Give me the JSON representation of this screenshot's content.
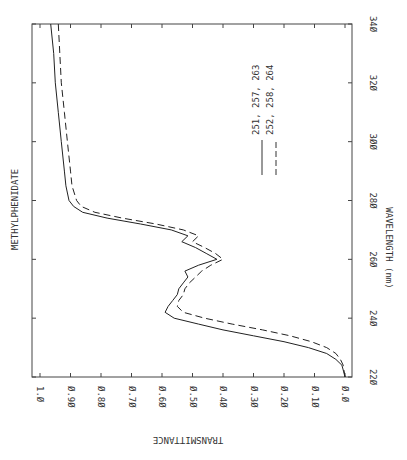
{
  "chart_data": {
    "type": "line",
    "title": "METHYLPHENIDATE",
    "xlabel": "WAVELENGTH (nm)",
    "ylabel": "TRANSMITTANCE",
    "orientation": "rotated 90° (wavelength axis vertical on right, transmittance axis horizontal along bottom, reversed)",
    "xlim": [
      220,
      340
    ],
    "ylim": [
      0.0,
      1.0
    ],
    "x_ticks": [
      "220",
      "240",
      "260",
      "280",
      "300",
      "320",
      "340"
    ],
    "y_ticks": [
      "1.0",
      "0.90",
      "0.80",
      "0.70",
      "0.60",
      "0.50",
      "0.40",
      "0.30",
      "0.20",
      "0.10",
      "0.0"
    ],
    "grid": false,
    "legend_position": "upper-center",
    "series": [
      {
        "name": "251, 257, 263",
        "style": "solid",
        "x": [
          220,
          222,
          224,
          226,
          228,
          230,
          232,
          234,
          236,
          238,
          240,
          242,
          244,
          246,
          248,
          250,
          252,
          254,
          256,
          258,
          260,
          262,
          264,
          266,
          268,
          270,
          272,
          274,
          276,
          278,
          280,
          285,
          290,
          300,
          310,
          320,
          330,
          340
        ],
        "values": [
          0.0,
          0.005,
          0.01,
          0.03,
          0.06,
          0.12,
          0.2,
          0.3,
          0.4,
          0.48,
          0.56,
          0.59,
          0.58,
          0.565,
          0.55,
          0.545,
          0.53,
          0.515,
          0.525,
          0.48,
          0.42,
          0.455,
          0.49,
          0.535,
          0.515,
          0.57,
          0.67,
          0.78,
          0.86,
          0.89,
          0.905,
          0.915,
          0.92,
          0.93,
          0.94,
          0.95,
          0.955,
          0.965
        ]
      },
      {
        "name": "252, 258, 264",
        "style": "dashed",
        "x": [
          220,
          222,
          224,
          226,
          228,
          230,
          232,
          234,
          236,
          238,
          240,
          242,
          244,
          246,
          248,
          250,
          252,
          254,
          256,
          258,
          260,
          262,
          264,
          266,
          268,
          270,
          272,
          274,
          276,
          278,
          280,
          285,
          290,
          300,
          310,
          320,
          330,
          340
        ],
        "values": [
          0.0,
          0.003,
          0.006,
          0.015,
          0.03,
          0.06,
          0.11,
          0.18,
          0.27,
          0.37,
          0.46,
          0.53,
          0.55,
          0.545,
          0.53,
          0.525,
          0.51,
          0.49,
          0.47,
          0.44,
          0.4,
          0.425,
          0.46,
          0.5,
          0.48,
          0.53,
          0.62,
          0.73,
          0.82,
          0.865,
          0.88,
          0.895,
          0.9,
          0.91,
          0.92,
          0.93,
          0.935,
          0.94
        ]
      }
    ]
  },
  "legend": {
    "items": [
      {
        "label": "251, 257, 263",
        "style": "solid"
      },
      {
        "label": "252, 258, 264",
        "style": "dashed"
      }
    ]
  },
  "labels": {
    "title": "METHYLPHENIDATE",
    "xlabel": "WAVELENGTH (nm)",
    "ylabel": "TRANSMITTANCE"
  }
}
